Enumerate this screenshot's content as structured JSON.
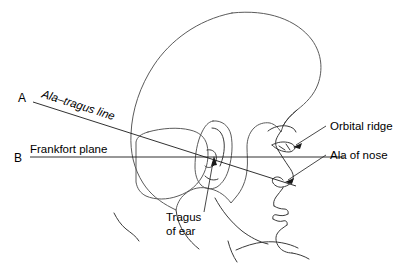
{
  "figure": {
    "background_color": "#ffffff",
    "line_color": "#1a1a1a",
    "outline_color": "#5b5b5b",
    "hair_shade_light": "#fbfbfb",
    "hair_shade_dark": "#c9c9c9"
  },
  "markers": {
    "a": "A",
    "b": "B"
  },
  "labels": {
    "ala_tragus_line": "Ala–tragus line",
    "frankfort_plane": "Frankfort plane",
    "orbital_ridge": "Orbital ridge",
    "ala_of_nose": "Ala of nose",
    "tragus_line1": "Tragus",
    "tragus_line2": "of ear"
  }
}
